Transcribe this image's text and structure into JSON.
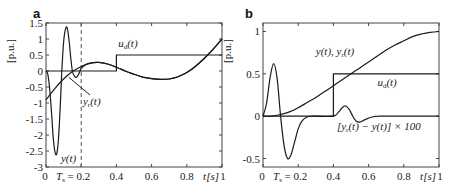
{
  "chart_data": [
    {
      "panel": "a",
      "type": "line",
      "ylabel": "[p.u.]",
      "xlabel": "t[s]",
      "xlim": [
        0,
        1
      ],
      "ylim": [
        -3,
        1.5
      ],
      "xticks": [
        "0",
        "0.2",
        "0.4",
        "0.6",
        "0.8",
        "1"
      ],
      "xtick_values": [
        0,
        0.2,
        0.4,
        0.6,
        0.8,
        1
      ],
      "yticks": [
        "1.5",
        "1",
        "0.5",
        "0",
        "-0.5",
        "-1",
        "-1.5",
        "-2",
        "-2.5",
        "-3"
      ],
      "ytick_values": [
        1.5,
        1,
        0.5,
        0,
        -0.5,
        -1,
        -1.5,
        -2,
        -2.5,
        -3
      ],
      "ts_label": "T",
      "ts_sub": "s",
      "ts_value": "= 0.2",
      "vline_x": 0.2,
      "series": [
        {
          "name": "y(t)",
          "x": [
            0,
            0.01,
            0.02,
            0.03,
            0.04,
            0.05,
            0.06,
            0.07,
            0.08,
            0.09,
            0.1,
            0.11,
            0.12,
            0.13,
            0.14,
            0.15,
            0.16,
            0.17,
            0.18,
            0.19,
            0.2,
            0.22,
            0.25,
            0.3,
            0.35,
            0.4,
            0.45,
            0.5,
            0.55,
            0.6,
            0.65,
            0.7,
            0.75,
            0.8,
            0.85,
            0.9,
            0.95,
            1.0
          ],
          "values": [
            0,
            -0.1,
            -0.5,
            -1.2,
            -2.0,
            -2.5,
            -2.6,
            -2.2,
            -1.2,
            0.0,
            0.9,
            1.3,
            1.35,
            1.0,
            0.45,
            0.0,
            -0.15,
            -0.2,
            -0.15,
            -0.05,
            0.08,
            0.18,
            0.25,
            0.27,
            0.22,
            0.12,
            0.0,
            -0.1,
            -0.19,
            -0.24,
            -0.26,
            -0.25,
            -0.18,
            -0.05,
            0.15,
            0.4,
            0.68,
            1.0
          ]
        },
        {
          "name": "y_r(t)",
          "x": [
            0,
            0.05,
            0.1,
            0.15,
            0.2,
            0.25,
            0.3,
            0.35,
            0.4,
            0.45,
            0.5,
            0.55,
            0.6,
            0.65,
            0.7,
            0.75,
            0.8,
            0.85,
            0.9,
            0.95,
            1.0
          ],
          "values": [
            -0.9,
            -0.55,
            -0.25,
            -0.02,
            0.14,
            0.24,
            0.27,
            0.22,
            0.12,
            0.0,
            -0.1,
            -0.19,
            -0.24,
            -0.26,
            -0.25,
            -0.18,
            -0.05,
            0.15,
            0.4,
            0.68,
            1.0
          ]
        },
        {
          "name": "u_d(t)",
          "x": [
            0,
            0.4,
            0.4,
            1.0
          ],
          "values": [
            0,
            0,
            0.5,
            0.5
          ]
        }
      ],
      "annotations": [
        {
          "text": "u",
          "sub": "d",
          "rest": "(t)",
          "x": 0.41,
          "y": 0.75
        },
        {
          "text": "y",
          "sub": "r",
          "rest": "(t)",
          "x": 0.21,
          "y": -1.05
        },
        {
          "text": "y",
          "sub": "",
          "rest": "(t)",
          "x": 0.085,
          "y": -2.85
        }
      ]
    },
    {
      "panel": "b",
      "type": "line",
      "ylabel": "[p.u.]",
      "xlabel": "t[s]",
      "xlim": [
        0,
        1
      ],
      "ylim": [
        -0.6,
        1.1
      ],
      "xticks": [
        "0",
        "0.2",
        "0.4",
        "0.6",
        "0.8",
        "1"
      ],
      "xtick_values": [
        0,
        0.2,
        0.4,
        0.6,
        0.8,
        1
      ],
      "yticks": [
        "1",
        "0.5",
        "0",
        "-0.5"
      ],
      "ytick_values": [
        1,
        0.5,
        0,
        -0.5
      ],
      "ts_label": "T",
      "ts_sub": "s",
      "ts_value": "= 0.2",
      "series": [
        {
          "name": "y(t), y_r(t)",
          "x": [
            0,
            0.05,
            0.1,
            0.15,
            0.2,
            0.25,
            0.3,
            0.35,
            0.4,
            0.45,
            0.5,
            0.55,
            0.6,
            0.65,
            0.7,
            0.75,
            0.8,
            0.85,
            0.9,
            0.95,
            1.0
          ],
          "values": [
            0,
            0.0,
            0.02,
            0.05,
            0.1,
            0.16,
            0.22,
            0.29,
            0.36,
            0.43,
            0.5,
            0.57,
            0.64,
            0.71,
            0.78,
            0.84,
            0.89,
            0.94,
            0.97,
            0.99,
            1.0
          ]
        },
        {
          "name": "[y_r(t) - y(t)] x 100",
          "x": [
            0,
            0.02,
            0.04,
            0.06,
            0.08,
            0.1,
            0.12,
            0.14,
            0.16,
            0.18,
            0.2,
            0.22,
            0.25,
            0.28,
            0.3,
            0.4,
            0.43,
            0.45,
            0.47,
            0.49,
            0.51,
            0.53,
            0.55,
            0.58,
            0.62,
            0.66,
            0.7,
            1.0
          ],
          "values": [
            0,
            0.15,
            0.45,
            0.62,
            0.45,
            0.0,
            -0.35,
            -0.5,
            -0.45,
            -0.3,
            -0.15,
            -0.06,
            -0.01,
            0,
            0,
            0,
            0.05,
            0.1,
            0.12,
            0.08,
            0.0,
            -0.06,
            -0.07,
            -0.04,
            -0.01,
            0,
            0,
            0
          ]
        },
        {
          "name": "u_d(t)",
          "x": [
            0,
            0.4,
            0.4,
            1.0
          ],
          "values": [
            0,
            0,
            0.5,
            0.5
          ]
        }
      ],
      "annotations": [
        {
          "text": "y(t), y",
          "sub": "r",
          "rest": "(t)",
          "x": 0.3,
          "y": 0.72
        },
        {
          "text": "u",
          "sub": "d",
          "rest": "(t)",
          "x": 0.65,
          "y": 0.36
        },
        {
          "text": "[y",
          "sub": "r",
          "rest": "(t) − y(t)] × 100",
          "x": 0.42,
          "y": -0.16
        }
      ]
    }
  ]
}
